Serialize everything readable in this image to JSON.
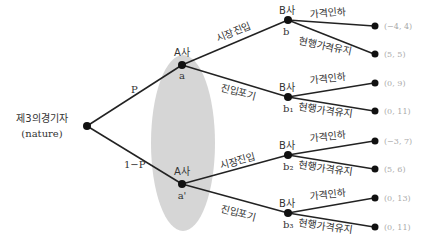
{
  "diagram": {
    "type": "game-tree",
    "info_set_color": "#d6d6d6",
    "root": {
      "label_line1": "제3의경기자",
      "label_line2": "(nature)"
    },
    "nature_moves": {
      "upper": "P",
      "lower": "1−P"
    },
    "a_nodes": [
      {
        "player": "A사",
        "id": "a"
      },
      {
        "player": "A사",
        "id": "a'"
      }
    ],
    "a_moves": {
      "enter": "시장진입",
      "stay_out": "진입포기"
    },
    "b_nodes": [
      {
        "player": "B사",
        "id": "b"
      },
      {
        "player": "B사",
        "id": "b₁"
      },
      {
        "player": "B사",
        "id": "b₂"
      },
      {
        "player": "B사",
        "id": "b₃"
      }
    ],
    "b_moves": {
      "cut": "가격인하",
      "keep": "현행가격유지"
    },
    "payoffs": [
      "(−4, 4)",
      "(5, 5)",
      "(0, 9)",
      "(0, 11)",
      "(−3, 7)",
      "(5, 6)",
      "(0, 13)",
      "(0, 11)"
    ]
  }
}
